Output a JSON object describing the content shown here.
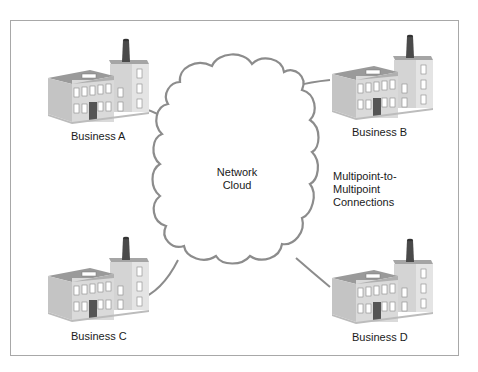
{
  "diagram": {
    "cloud": {
      "label_line1": "Network",
      "label_line2": "Cloud",
      "stroke_color": "#8c8c8c"
    },
    "connection_note": {
      "line1": "Multipoint-to-",
      "line2": "Multipoint",
      "line3": "Connections"
    },
    "nodes": [
      {
        "id": "A",
        "label": "Business A",
        "icon": "factory-building-icon"
      },
      {
        "id": "B",
        "label": "Business B",
        "icon": "factory-building-icon"
      },
      {
        "id": "C",
        "label": "Business C",
        "icon": "factory-building-icon"
      },
      {
        "id": "D",
        "label": "Business D",
        "icon": "factory-building-icon"
      }
    ],
    "edges": [
      {
        "from": "A",
        "to": "cloud"
      },
      {
        "from": "B",
        "to": "cloud"
      },
      {
        "from": "C",
        "to": "cloud"
      },
      {
        "from": "D",
        "to": "cloud"
      }
    ],
    "colors": {
      "frame": "#a8a8a8",
      "line": "#8c8c8c",
      "building_front": "#d9d9d9",
      "building_side": "#c4c4c4",
      "building_roof": "#9a9a9a",
      "door": "#555555",
      "chimney": "#4a4a4a"
    }
  }
}
